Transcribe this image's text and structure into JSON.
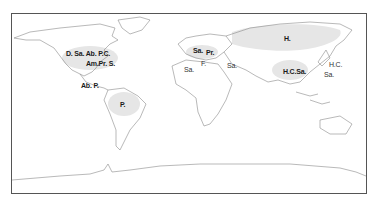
{
  "map": {
    "type": "world outline map",
    "shade_color": "#e6e6e6",
    "outline_color": "#8a8a8a",
    "frame_color": "#555555",
    "labels": [
      {
        "id": "na-1",
        "text": "D. Sa. Ab. P.C.",
        "region": "North America",
        "x": 66,
        "y": 52,
        "bold": true
      },
      {
        "id": "na-2",
        "text": "Am.Pr. S.",
        "region": "North America (east)",
        "x": 86,
        "y": 62,
        "bold": true
      },
      {
        "id": "ca-1",
        "text": "Ab. P.",
        "region": "Central America",
        "x": 81,
        "y": 84,
        "bold": true
      },
      {
        "id": "sa-1",
        "text": "P.",
        "region": "South America",
        "x": 120,
        "y": 103,
        "bold": true
      },
      {
        "id": "eu-1",
        "text": "Sa.",
        "region": "Western Europe",
        "x": 193,
        "y": 49,
        "bold": true
      },
      {
        "id": "eu-2",
        "text": "Pr.",
        "region": "Central Europe",
        "x": 206,
        "y": 51,
        "bold": true
      },
      {
        "id": "eu-3",
        "text": "F.",
        "region": "Italy",
        "x": 201,
        "y": 62,
        "bold": false
      },
      {
        "id": "af-1",
        "text": "Sa.",
        "region": "North Africa",
        "x": 184,
        "y": 68,
        "bold": false
      },
      {
        "id": "me-1",
        "text": "Sa.",
        "region": "Middle East",
        "x": 227,
        "y": 64,
        "bold": false
      },
      {
        "id": "as-1",
        "text": "H.",
        "region": "Siberia",
        "x": 284,
        "y": 37,
        "bold": true
      },
      {
        "id": "as-2",
        "text": "H.C.Sa.",
        "region": "China",
        "x": 283,
        "y": 70,
        "bold": true
      },
      {
        "id": "as-3",
        "text": "H.C.",
        "region": "Japan",
        "x": 329,
        "y": 63,
        "bold": false
      },
      {
        "id": "as-4",
        "text": "Sa.",
        "region": "Japan",
        "x": 324,
        "y": 73,
        "bold": false
      }
    ]
  }
}
